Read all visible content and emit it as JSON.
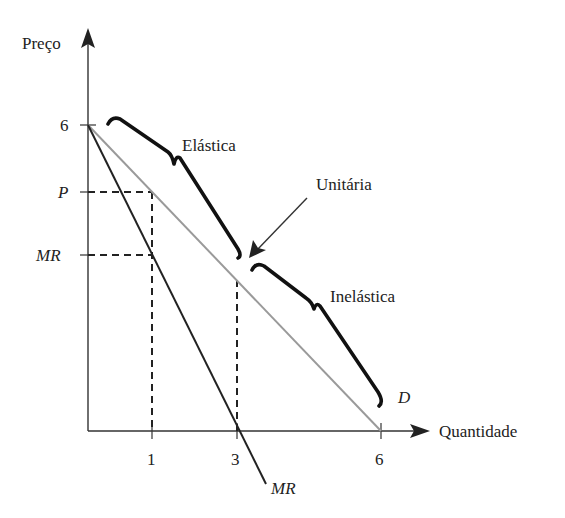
{
  "diagram": {
    "axes": {
      "y_label": "Preço",
      "x_label": "Quantidade",
      "y_ticks": [
        {
          "label": "6",
          "value": 6
        },
        {
          "label": "P",
          "value": "P"
        },
        {
          "label": "MR",
          "value": "MR"
        }
      ],
      "x_ticks": [
        {
          "label": "1",
          "value": 1
        },
        {
          "label": "3",
          "value": 3
        },
        {
          "label": "6",
          "value": 6
        }
      ]
    },
    "curves": {
      "demand": {
        "label": "D",
        "color": "#9a9a9a",
        "from": [
          0,
          6
        ],
        "to": [
          6,
          0
        ]
      },
      "marginal_revenue": {
        "label": "MR",
        "color": "#222222",
        "from": [
          0,
          6
        ],
        "to": [
          3,
          0
        ]
      }
    },
    "regions": {
      "elastic": "Elástica",
      "unitary": "Unitária",
      "inelastic": "Inelástica"
    },
    "colors": {
      "axis": "#333333",
      "demand": "#9a9a9a",
      "mr": "#222222",
      "brace": "#111111",
      "dashed": "#222222"
    }
  }
}
